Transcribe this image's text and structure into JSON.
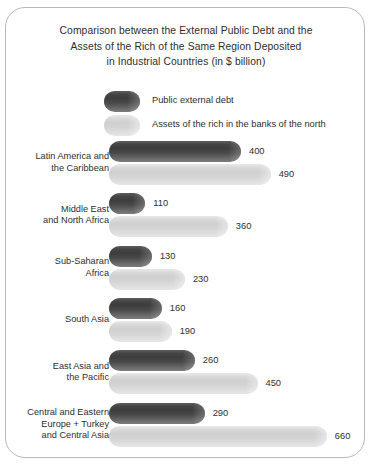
{
  "chart_data": {
    "type": "bar",
    "orientation": "horizontal",
    "title": "Comparison between the External Public Debt and the Assets of the Rich of the Same Region Deposited in Industrial Countries (in $ billion)",
    "title_lines": [
      "Comparison between the External Public Debt and the",
      "Assets of the Rich of the Same Region Deposited",
      "in Industrial Countries (in $ billion)"
    ],
    "xlabel": "",
    "ylabel": "",
    "unit": "$ billion",
    "grid": false,
    "legend_position": "top",
    "xlim": [
      0,
      660
    ],
    "categories": [
      "Latin America and the Caribbean",
      "Middle East and North Africa",
      "Sub-Saharan Africa",
      "South Asia",
      "East Asia and the Pacific",
      "Central and Eastern Europe + Turkey and Central Asia"
    ],
    "category_lines": [
      [
        "Latin America and",
        "the Caribbean"
      ],
      [
        "Middle East",
        "and North Africa"
      ],
      [
        "Sub-Saharan",
        "Africa"
      ],
      [
        "South Asia"
      ],
      [
        "East Asia and",
        "the Pacific"
      ],
      [
        "Central and Eastern",
        "Europe + Turkey",
        "and Central Asia"
      ]
    ],
    "series": [
      {
        "name": "Public external debt",
        "color": "#454545",
        "values": [
          400,
          110,
          130,
          160,
          260,
          290
        ],
        "labels": [
          "400",
          "110",
          "130",
          "160",
          "260",
          "290"
        ]
      },
      {
        "name": "Assets of the rich in the banks of the north",
        "color": "#d4d4d4",
        "values": [
          490,
          360,
          230,
          190,
          450,
          660
        ],
        "labels": [
          "490",
          "360",
          "230",
          "190",
          "450",
          "660"
        ]
      }
    ]
  },
  "legend": {
    "items": [
      {
        "label": "Public external debt",
        "swatch": "dark-cylinder-swatch"
      },
      {
        "label": "Assets of the rich in the banks of the north",
        "swatch": "light-cylinder-swatch"
      }
    ]
  },
  "colors": {
    "dark_bar": "#454545",
    "light_bar": "#d4d4d4",
    "border": "#b9b9b9",
    "background": "#ffffff",
    "text": "#2e2e2e"
  }
}
